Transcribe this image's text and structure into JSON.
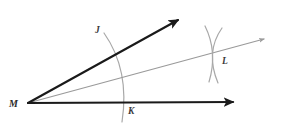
{
  "figure": {
    "background_color": "#ffffff",
    "width": 282,
    "height": 126
  },
  "colors": {
    "ray_stroke": "#1a1a1a",
    "construction_stroke": "#a8a8a8",
    "bisector_stroke": "#9a9a9a",
    "label_color": "#2b2b2b"
  },
  "labels": {
    "vertex": "M",
    "point_j": "J",
    "point_k": "K",
    "point_l": "L"
  },
  "points": {
    "M": {
      "x": 28,
      "y": 103
    },
    "J": {
      "x": 98,
      "y": 30
    },
    "K": {
      "x": 131,
      "y": 111
    },
    "L": {
      "x": 225,
      "y": 61
    }
  },
  "rays": [
    {
      "name": "upper-ray-MJ",
      "from": {
        "x": 28,
        "y": 103
      },
      "to": {
        "x": 182,
        "y": 17
      },
      "color": "#1a1a1a",
      "width": 2.1,
      "arrow": true
    },
    {
      "name": "lower-ray-MK",
      "from": {
        "x": 28,
        "y": 103
      },
      "to": {
        "x": 238,
        "y": 102
      },
      "color": "#1a1a1a",
      "width": 2.1,
      "arrow": true
    },
    {
      "name": "bisector-ray-ML",
      "from": {
        "x": 28,
        "y": 103
      },
      "to": {
        "x": 268,
        "y": 38
      },
      "color": "#9a9a9a",
      "width": 1.2,
      "arrow": true
    }
  ],
  "arcs": [
    {
      "name": "vertex-arc-JK",
      "path": "M 104 33 Q 130 70 122 122",
      "color": "#a8a8a8",
      "width": 1.2
    },
    {
      "name": "intersection-arc-from-J",
      "path": "M 205 26 Q 218 52 209 82",
      "color": "#a8a8a8",
      "width": 1.2
    },
    {
      "name": "intersection-arc-from-K",
      "path": "M 222 28 Q 205 52 218 83",
      "color": "#a8a8a8",
      "width": 1.2
    }
  ],
  "notes": {
    "construction": "Arc centered at M crosses the two rays at J and K; arcs centered at J and K cross at L; ray ML bisects angle JMK."
  }
}
